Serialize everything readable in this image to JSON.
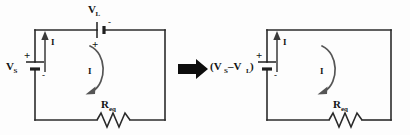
{
  "figure": {
    "background_color": "#fdfdfd",
    "wire_color": "#2b2b2b",
    "label_color": "#141414",
    "loop_arrow_color": "#555555",
    "transform_arrow_color": "#0d0d0d"
  },
  "left_circuit": {
    "name": "original-circuit",
    "source": {
      "label_base": "V",
      "label_sub": "S",
      "plus_sign": "+",
      "minus_sign": "-"
    },
    "load_source": {
      "label_base": "V",
      "label_sub": "L",
      "plus_sign": "+",
      "minus_sign": "-"
    },
    "resistor": {
      "label_base": "R",
      "label_sub": "eq"
    },
    "branch_current_label": "I",
    "loop_current_label": "I"
  },
  "transform_arrow": {
    "name": "implies-arrow",
    "glyph": "→"
  },
  "right_circuit": {
    "name": "equivalent-circuit",
    "source": {
      "label_text": "(V",
      "label_sub_1": "S",
      "label_mid": " –V",
      "label_sub_2": "L",
      "label_close": ")",
      "plus_sign": "+",
      "minus_sign": "-"
    },
    "resistor": {
      "label_base": "R",
      "label_sub": "eq"
    },
    "branch_current_label": "I",
    "loop_current_label": "I"
  }
}
